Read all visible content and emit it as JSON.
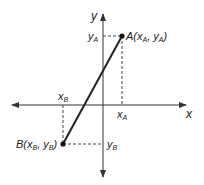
{
  "diagram": {
    "type": "coordinate-plane",
    "axes": {
      "x_label": "x",
      "y_label": "y"
    },
    "points": {
      "A": {
        "label": "A(x",
        "sub1": "A",
        "mid": ", y",
        "sub2": "A",
        "end": ")"
      },
      "B": {
        "label": "B(x",
        "sub1": "B",
        "mid": ", y",
        "sub2": "B",
        "end": ")"
      }
    },
    "projections": {
      "xA": {
        "base": "x",
        "sub": "A"
      },
      "yA": {
        "base": "y",
        "sub": "A"
      },
      "xB": {
        "base": "x",
        "sub": "B"
      },
      "yB": {
        "base": "y",
        "sub": "B"
      }
    },
    "colors": {
      "line": "#222222",
      "axis": "#333333",
      "dashed": "#444444",
      "background": "#ffffff"
    }
  }
}
